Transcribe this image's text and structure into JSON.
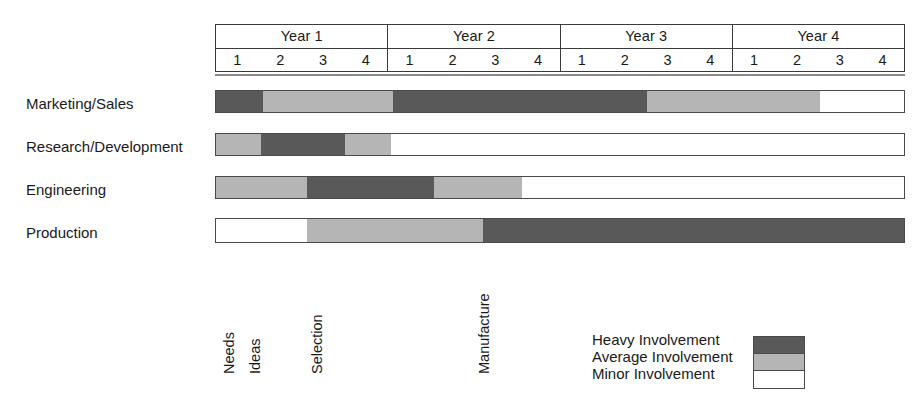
{
  "chart_data": {
    "type": "bar",
    "chart_kind": "gantt-involvement-matrix",
    "title": "",
    "xlabel": "",
    "ylabel": "",
    "axis": {
      "unit": "quarter",
      "total_quarters": 16,
      "x_start_quarter": 1,
      "x_end_quarter": 16,
      "grid": false
    },
    "years": [
      {
        "label": "Year 1",
        "quarters": [
          "1",
          "2",
          "3",
          "4"
        ]
      },
      {
        "label": "Year 2",
        "quarters": [
          "1",
          "2",
          "3",
          "4"
        ]
      },
      {
        "label": "Year 3",
        "quarters": [
          "1",
          "2",
          "3",
          "4"
        ]
      },
      {
        "label": "Year 4",
        "quarters": [
          "1",
          "2",
          "3",
          "4"
        ]
      }
    ],
    "involvement_levels": [
      {
        "key": "heavy",
        "label": "Heavy Involvement",
        "color": "#595959"
      },
      {
        "key": "average",
        "label": "Average Involvement",
        "color": "#b5b5b5"
      },
      {
        "key": "minor",
        "label": "Minor Involvement",
        "color": "#ffffff"
      }
    ],
    "rows": [
      {
        "label": "Marketing/Sales",
        "segments": [
          {
            "level": "heavy",
            "start_quarter": 0.0,
            "end_quarter": 1.1
          },
          {
            "level": "average",
            "start_quarter": 1.1,
            "end_quarter": 4.1
          },
          {
            "level": "heavy",
            "start_quarter": 4.1,
            "end_quarter": 10.0
          },
          {
            "level": "average",
            "start_quarter": 10.0,
            "end_quarter": 14.0
          },
          {
            "level": "minor",
            "start_quarter": 14.0,
            "end_quarter": 16.0
          }
        ]
      },
      {
        "label": "Research/Development",
        "segments": [
          {
            "level": "average",
            "start_quarter": 0.0,
            "end_quarter": 1.05
          },
          {
            "level": "heavy",
            "start_quarter": 1.05,
            "end_quarter": 3.0
          },
          {
            "level": "average",
            "start_quarter": 3.0,
            "end_quarter": 4.05
          },
          {
            "level": "minor",
            "start_quarter": 4.05,
            "end_quarter": 16.0
          }
        ]
      },
      {
        "label": "Engineering",
        "segments": [
          {
            "level": "average",
            "start_quarter": 0.0,
            "end_quarter": 2.1
          },
          {
            "level": "heavy",
            "start_quarter": 2.1,
            "end_quarter": 5.05
          },
          {
            "level": "average",
            "start_quarter": 5.05,
            "end_quarter": 7.1
          },
          {
            "level": "minor",
            "start_quarter": 7.1,
            "end_quarter": 16.0
          }
        ]
      },
      {
        "label": "Production",
        "segments": [
          {
            "level": "minor",
            "start_quarter": 0.0,
            "end_quarter": 2.1
          },
          {
            "level": "average",
            "start_quarter": 2.1,
            "end_quarter": 6.2
          },
          {
            "level": "heavy",
            "start_quarter": 6.2,
            "end_quarter": 16.0
          }
        ]
      }
    ],
    "milestones": [
      {
        "label": "Needs",
        "quarter": 0.18
      },
      {
        "label": "Ideas",
        "quarter": 0.78
      },
      {
        "label": "Selection",
        "quarter": 2.23
      },
      {
        "label": "Manufacture",
        "quarter": 6.1
      }
    ]
  }
}
